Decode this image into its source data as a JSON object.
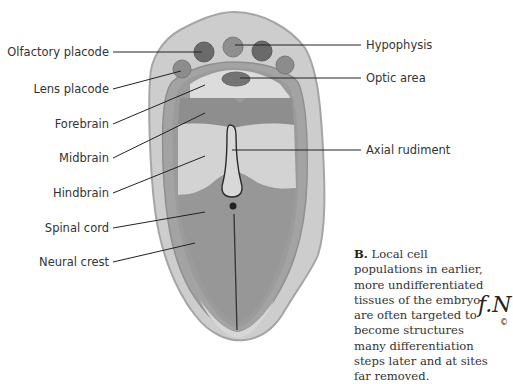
{
  "figure": {
    "panel": "B",
    "labels_left": [
      {
        "id": "olfactory-placode",
        "text": "Olfactory placode"
      },
      {
        "id": "lens-placode",
        "text": "Lens placode"
      },
      {
        "id": "forebrain",
        "text": "Forebrain"
      },
      {
        "id": "midbrain",
        "text": "Midbrain"
      },
      {
        "id": "hindbrain",
        "text": "Hindbrain"
      },
      {
        "id": "spinal-cord",
        "text": "Spinal cord"
      },
      {
        "id": "neural-crest",
        "text": "Neural crest"
      }
    ],
    "labels_right": [
      {
        "id": "hypophysis",
        "text": "Hypophysis"
      },
      {
        "id": "optic-area",
        "text": "Optic area"
      },
      {
        "id": "axial-rudiment",
        "text": "Axial rudiment"
      }
    ],
    "caption": {
      "bold": "B.",
      "text": " Local cell populations in earlier, more undifferentiated tissues of the embryo are often targeted to become structures many differentiation steps later and at sites far removed."
    },
    "signature": {
      "glyph": "f.N",
      "copyright": "©"
    },
    "colors": {
      "outer_body": "#c9c9c9",
      "outer_edge": "#a8a8a8",
      "neural_plate": "#9a9a9a",
      "forebrain": "#d9d9d9",
      "midbrain": "#8c8c8c",
      "hindbrain": "#d2d2d2",
      "spinal_cord": "#959595",
      "placode_dark": "#6e6e6e",
      "placode_mid": "#8a8a8a"
    }
  }
}
